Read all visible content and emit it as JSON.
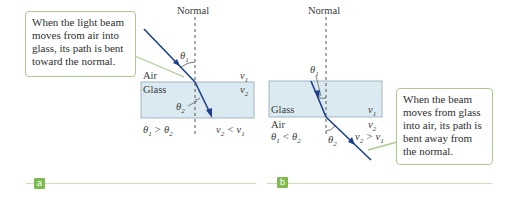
{
  "panels": [
    {
      "tag": "a",
      "normal_label": "Normal",
      "callout": "When the light beam moves from air into glass, its path is bent toward the normal.",
      "top_medium": "Air",
      "bottom_medium": "Glass",
      "v_top": "v1",
      "v_bottom": "v2",
      "theta1_label": "θ1",
      "theta2_label": "θ2",
      "relation_angles": "θ1 > θ2",
      "relation_speeds": "v2 < v1"
    },
    {
      "tag": "b",
      "normal_label": "Normal",
      "callout": "When the beam moves from glass into air, its path is bent away from the normal.",
      "top_medium": "Glass",
      "bottom_medium": "Air",
      "v_top": "v1",
      "v_bottom": "v2",
      "theta1_label": "θ1",
      "theta2_label": "θ2",
      "relation_angles": "θ1 < θ2",
      "relation_speeds": "v2 > v1"
    }
  ],
  "colors": {
    "beam": "#1f3f8f",
    "glass_fill": "#dbe9f1",
    "glass_stroke": "#9fb6c4",
    "callout_border": "#a9cc8c",
    "tag_fill": "#7dbb4e",
    "rule": "#c8dfb7"
  }
}
